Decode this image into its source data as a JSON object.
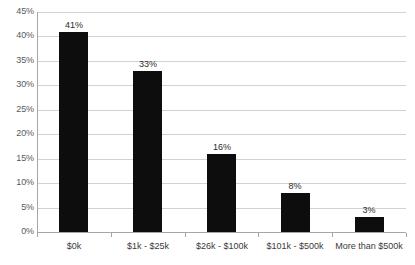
{
  "chart_data": {
    "type": "bar",
    "title": "",
    "subtitle": "",
    "xlabel": "",
    "ylabel": "",
    "categories": [
      "$0k",
      "$1k - $25k",
      "$26k - $100k",
      "$101k - $500k",
      "More than $500k"
    ],
    "values": [
      41,
      33,
      16,
      8,
      3
    ],
    "value_labels": [
      "41%",
      "33%",
      "16%",
      "8%",
      "3%"
    ],
    "ylim": [
      0,
      45
    ],
    "ytick_values": [
      0,
      5,
      10,
      15,
      20,
      25,
      30,
      35,
      40,
      45
    ],
    "ytick_labels": [
      "0%",
      "5%",
      "10%",
      "15%",
      "20%",
      "25%",
      "30%",
      "35%",
      "40%",
      "45%"
    ],
    "grid": true,
    "grid_axis": "y",
    "legend": false,
    "legend_position": "none",
    "bar_color": "#0d0d0d",
    "gridline_color": "#d2d2d2",
    "axis_color": "#a6a6a6",
    "label_color": "#59595b",
    "background_color": "#ffffff"
  }
}
